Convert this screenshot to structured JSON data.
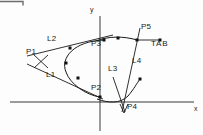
{
  "figure": {
    "background_color": "#fdfdfd",
    "stroke_color": "#1a1a1a",
    "axis_color": "#222222"
  },
  "axes": {
    "y_label": "y",
    "x_label": "x",
    "y_axis_x": 100,
    "x_axis_y": 102
  },
  "points": [
    {
      "id": "P1",
      "label": "P1",
      "x": 41,
      "y": 62,
      "label_x": 26,
      "label_y": 52
    },
    {
      "id": "P2",
      "label": "P2",
      "x": 100,
      "y": 97,
      "label_x": 92,
      "label_y": 85
    },
    {
      "id": "P3",
      "label": "P3",
      "x": 104,
      "y": 40,
      "label_x": 92,
      "label_y": 43
    },
    {
      "id": "P4",
      "label": "P4",
      "x": 124,
      "y": 107,
      "label_x": 127,
      "label_y": 104
    },
    {
      "id": "P5",
      "label": "P5",
      "x": 137,
      "y": 40,
      "label_x": 141,
      "label_y": 26
    }
  ],
  "lines": [
    {
      "id": "L1",
      "label": "L1",
      "label_x": 48,
      "label_y": 75
    },
    {
      "id": "L2",
      "label": "L2",
      "label_x": 49,
      "label_y": 39
    },
    {
      "id": "L3",
      "label": "L3",
      "label_x": 110,
      "label_y": 69
    },
    {
      "id": "L4",
      "label": "L4",
      "label_x": 133,
      "label_y": 61
    }
  ],
  "annotations": [
    {
      "id": "TAB",
      "label": "TAB",
      "label_x": 151,
      "label_y": 43
    }
  ],
  "markers": {
    "style": "filled-square",
    "size": 3,
    "color": "#101010",
    "curve_markers": [
      {
        "x": 70,
        "y": 48
      },
      {
        "x": 66,
        "y": 63
      },
      {
        "x": 78,
        "y": 78
      },
      {
        "x": 118,
        "y": 38
      },
      {
        "x": 137,
        "y": 40
      },
      {
        "x": 140,
        "y": 79
      }
    ]
  },
  "partial_border": {
    "present": true,
    "x": 0,
    "y": 0,
    "width": 24,
    "height": 5
  }
}
